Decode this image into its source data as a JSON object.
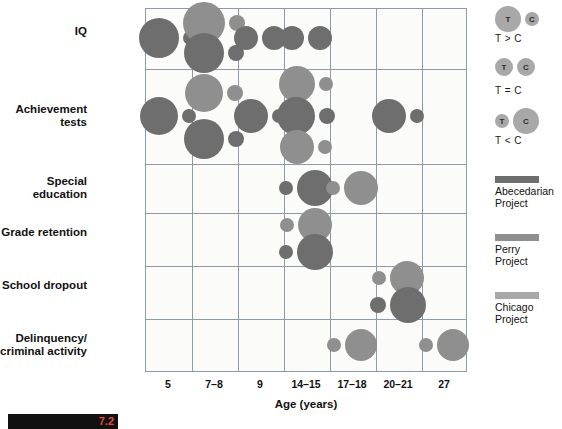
{
  "chart_data": {
    "type": "bubble",
    "title": "",
    "xlabel": "Age (years)",
    "ylabel": "",
    "categories_x": [
      "5",
      "7–8",
      "9",
      "14–15",
      "17–18",
      "20–21",
      "27"
    ],
    "categories_y": [
      "IQ",
      "Achievement tests",
      "Special education",
      "Grade retention",
      "School dropout",
      "Delinquency/\ncriminal activity"
    ],
    "encoding": {
      "bubble_pair": "Left bubble = Treatment (T), right bubble = Control (C)",
      "size": "Relative magnitude of outcome",
      "color": "Intervention project"
    },
    "series_colors": {
      "abecedarian": "#6e6e6e",
      "perry": "#8f8f8f",
      "chicago": "#a8a8a8"
    },
    "points": [
      {
        "row": "IQ",
        "age": "5",
        "project": "abecedarian",
        "relation": "T > C",
        "t_size": 20,
        "c_size": 7
      },
      {
        "row": "IQ",
        "age": "7–8",
        "project": "perry",
        "relation": "T > C",
        "t_size": 21,
        "c_size": 8
      },
      {
        "row": "IQ",
        "age": "7–8",
        "project": "abecedarian",
        "relation": "T > C",
        "t_size": 20,
        "c_size": 8
      },
      {
        "row": "IQ",
        "age": "9",
        "project": "abecedarian",
        "relation": "T = C",
        "t_size": 12,
        "c_size": 12
      },
      {
        "row": "IQ",
        "age": "14–15",
        "project": "abecedarian",
        "relation": "T = C",
        "t_size": 12,
        "c_size": 12
      },
      {
        "row": "Achievement tests",
        "age": "5",
        "project": "abecedarian",
        "relation": "T > C",
        "t_size": 19,
        "c_size": 7
      },
      {
        "row": "Achievement tests",
        "age": "7–8",
        "project": "perry",
        "relation": "T > C",
        "t_size": 19,
        "c_size": 8
      },
      {
        "row": "Achievement tests",
        "age": "7–8",
        "project": "abecedarian",
        "relation": "T > C",
        "t_size": 20,
        "c_size": 8
      },
      {
        "row": "Achievement tests",
        "age": "9",
        "project": "abecedarian",
        "relation": "T > C",
        "t_size": 17,
        "c_size": 7
      },
      {
        "row": "Achievement tests",
        "age": "14–15",
        "project": "perry",
        "relation": "T > C",
        "t_size": 18,
        "c_size": 7
      },
      {
        "row": "Achievement tests",
        "age": "14–15",
        "project": "abecedarian",
        "relation": "T > C",
        "t_size": 19,
        "c_size": 8
      },
      {
        "row": "Achievement tests",
        "age": "14–15",
        "project": "perry",
        "relation": "T > C",
        "t_size": 17,
        "c_size": 7
      },
      {
        "row": "Achievement tests",
        "age": "20–21",
        "project": "abecedarian",
        "relation": "T > C",
        "t_size": 17,
        "c_size": 7
      },
      {
        "row": "Special education",
        "age": "14–15",
        "project": "abecedarian",
        "relation": "T < C",
        "t_size": 7,
        "c_size": 18
      },
      {
        "row": "Special education",
        "age": "17–18",
        "project": "perry",
        "relation": "T < C",
        "t_size": 7,
        "c_size": 17
      },
      {
        "row": "Grade retention",
        "age": "14–15",
        "project": "perry",
        "relation": "T < C",
        "t_size": 7,
        "c_size": 17
      },
      {
        "row": "Grade retention",
        "age": "14–15",
        "project": "abecedarian",
        "relation": "T < C",
        "t_size": 7,
        "c_size": 18
      },
      {
        "row": "School dropout",
        "age": "20–21",
        "project": "perry",
        "relation": "T < C",
        "t_size": 7,
        "c_size": 17
      },
      {
        "row": "School dropout",
        "age": "20–21",
        "project": "abecedarian",
        "relation": "T < C",
        "t_size": 8,
        "c_size": 18
      },
      {
        "row": "Delinquency/criminal activity",
        "age": "17–18",
        "project": "perry",
        "relation": "T < C",
        "t_size": 7,
        "c_size": 16
      },
      {
        "row": "Delinquency/criminal activity",
        "age": "27",
        "project": "perry",
        "relation": "T < C",
        "t_size": 7,
        "c_size": 16
      }
    ]
  },
  "rows": [
    {
      "label": "IQ"
    },
    {
      "label": "Achievement tests"
    },
    {
      "label": "Special education"
    },
    {
      "label": "Grade retention"
    },
    {
      "label": "School dropout"
    },
    {
      "label": "Delinquency/\ncriminal activity"
    }
  ],
  "xaxis": {
    "title": "Age (years)",
    "ticks": [
      "5",
      "7–8",
      "9",
      "14–15",
      "17–18",
      "20–21",
      "27"
    ]
  },
  "legend": {
    "relations": [
      {
        "t_label": "T",
        "c_label": "C",
        "caption": "T > C"
      },
      {
        "t_label": "T",
        "c_label": "C",
        "caption": "T = C"
      },
      {
        "t_label": "T",
        "c_label": "C",
        "caption": "T < C"
      }
    ],
    "projects": [
      {
        "label": "Abecedarian\nProject",
        "color": "#6e6e6e"
      },
      {
        "label": "Perry\nProject",
        "color": "#8f8f8f"
      },
      {
        "label": "Chicago\nProject",
        "color": "#a8a8a8"
      }
    ]
  },
  "footer": {
    "figure_number": "7.2"
  }
}
